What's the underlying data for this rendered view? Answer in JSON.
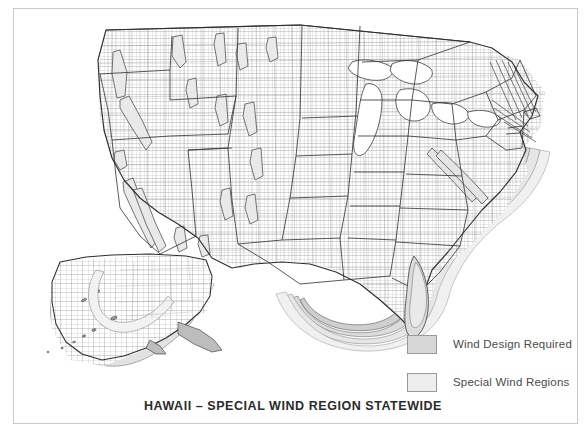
{
  "page": {
    "title": "HAWAII – SPECIAL WIND REGION STATEWIDE",
    "background_color": "#ffffff",
    "frame_border_color": "#c9c9c9"
  },
  "map": {
    "name": "united-states-wind-design-map",
    "description": "Map of the contiguous United States with Alaska inset showing wind design requirement zones and special wind regions",
    "outline_color": "#3a3a3a",
    "county_line_color": "#8f8f8f",
    "contour_color": "#555555",
    "zone_fill_dark": "#d7d7d7",
    "zone_fill_light": "#eeeeee"
  },
  "legend": {
    "items": [
      {
        "label": "Wind Design Required",
        "color": "#d7d7d7",
        "swatch": "swatch-wind-design-required"
      },
      {
        "label": "Special Wind Regions",
        "color": "#eeeeee",
        "swatch": "swatch-special-wind-regions"
      }
    ]
  }
}
